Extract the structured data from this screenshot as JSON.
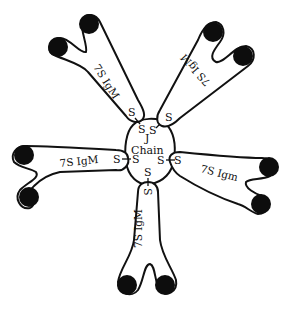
{
  "diagram": {
    "center": {
      "label_line1": "J",
      "label_line2": "Chain"
    },
    "monomers": [
      {
        "id": "top-left",
        "label": "7S IgM",
        "bond_outer": "S",
        "bond_inner": "S"
      },
      {
        "id": "top-right",
        "label": "7S IgM",
        "bond_outer": "S",
        "bond_inner": "S"
      },
      {
        "id": "left",
        "label": "7S IgM",
        "bond_outer": "S",
        "bond_inner": "S"
      },
      {
        "id": "right",
        "label": "7S Igm",
        "bond_outer": "S",
        "bond_inner": "S"
      },
      {
        "id": "bottom",
        "label": "7S IgM",
        "bond_outer": "S",
        "bond_inner": "S"
      }
    ],
    "colors": {
      "stroke": "#111111",
      "head_fill": "#0d0d0d",
      "background": "#ffffff"
    }
  }
}
